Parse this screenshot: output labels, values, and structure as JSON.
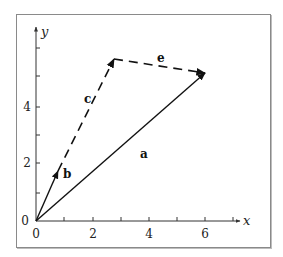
{
  "diagram": {
    "type": "vector-diagram",
    "axes": {
      "x": {
        "label": "x",
        "ticks": [
          "0",
          "2",
          "4",
          "6"
        ],
        "minor_ticks": [
          1,
          3,
          5,
          7
        ]
      },
      "y": {
        "label": "y",
        "ticks": [
          "0",
          "2",
          "4"
        ],
        "minor_ticks": [
          1,
          3,
          5
        ]
      }
    },
    "vectors": [
      {
        "name": "a",
        "label": "a",
        "from": [
          0,
          0
        ],
        "to": [
          6.0,
          5.3
        ],
        "style": "solid"
      },
      {
        "name": "b",
        "label": "b",
        "from": [
          0,
          0
        ],
        "to": [
          0.8,
          1.75
        ],
        "style": "solid"
      },
      {
        "name": "c",
        "label": "c",
        "from": [
          0.8,
          1.75
        ],
        "to": [
          2.8,
          5.8
        ],
        "style": "dashed"
      },
      {
        "name": "e",
        "label": "e",
        "from": [
          2.8,
          5.8
        ],
        "to": [
          6.0,
          5.3
        ],
        "style": "dashed"
      }
    ],
    "colors": {
      "line": "#111111",
      "frame": "#8a8a8a",
      "axis": "#333333"
    }
  }
}
